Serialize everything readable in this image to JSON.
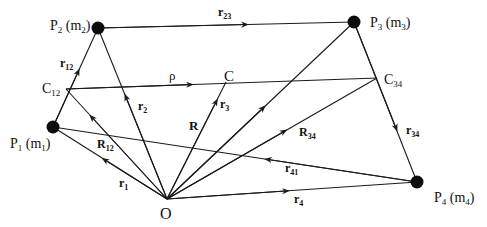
{
  "figure": {
    "points": [
      {
        "id": "P1",
        "label": "P",
        "sub": "1",
        "mass": "m",
        "mass_sub": "1",
        "x": 53,
        "y": 127
      },
      {
        "id": "P2",
        "label": "P",
        "sub": "2",
        "mass": "m",
        "mass_sub": "2",
        "x": 98,
        "y": 28
      },
      {
        "id": "P3",
        "label": "P",
        "sub": "3",
        "mass": "m",
        "mass_sub": "3",
        "x": 354,
        "y": 22
      },
      {
        "id": "P4",
        "label": "P",
        "sub": "4",
        "mass": "m",
        "mass_sub": "4",
        "x": 417,
        "y": 182
      }
    ],
    "centers": [
      {
        "id": "C12",
        "label": "C",
        "sub": "12"
      },
      {
        "id": "C34",
        "label": "C",
        "sub": "34"
      },
      {
        "id": "C",
        "label": "C",
        "sub": ""
      }
    ],
    "origin": {
      "label": "O"
    },
    "vectors": [
      {
        "id": "r1",
        "label": "r",
        "sub": "1",
        "from": "O",
        "to": "P1"
      },
      {
        "id": "r2",
        "label": "r",
        "sub": "2",
        "from": "O",
        "to": "P2"
      },
      {
        "id": "r3",
        "label": "r",
        "sub": "3",
        "from": "O",
        "to": "P3"
      },
      {
        "id": "r4",
        "label": "r",
        "sub": "4",
        "from": "O",
        "to": "P4"
      },
      {
        "id": "r12",
        "label": "r",
        "sub": "12",
        "from": "P1",
        "to": "P2"
      },
      {
        "id": "r23",
        "label": "r",
        "sub": "23",
        "from": "P2",
        "to": "P3"
      },
      {
        "id": "r34",
        "label": "r",
        "sub": "34",
        "from": "P3",
        "to": "P4"
      },
      {
        "id": "r41",
        "label": "r",
        "sub": "41",
        "from": "P4",
        "to": "P1"
      },
      {
        "id": "R",
        "label": "R",
        "sub": "",
        "from": "O",
        "to": "C"
      },
      {
        "id": "R12",
        "label": "R",
        "sub": "12",
        "from": "O",
        "to": "C12"
      },
      {
        "id": "R34",
        "label": "R",
        "sub": "34",
        "from": "O",
        "to": "C34"
      },
      {
        "id": "rho",
        "label": "ρ",
        "sub": "",
        "from": "C12",
        "to": "C34"
      }
    ]
  }
}
